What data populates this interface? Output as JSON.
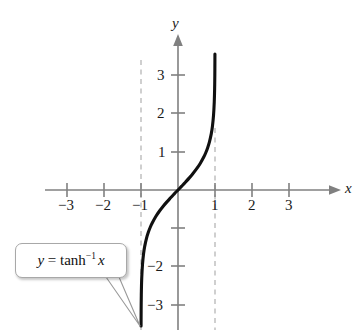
{
  "figure": {
    "background_color": "#ffffff",
    "width": 362,
    "height": 334
  },
  "chart_data": {
    "type": "line",
    "title": "",
    "xlabel": "x",
    "ylabel": "y",
    "function": "y = tanh^-1 x",
    "function_display": "y = tanh⁻¹ x",
    "xlim": [
      -3.9,
      4.1
    ],
    "ylim": [
      -3.7,
      3.8
    ],
    "grid": false,
    "legend": "none",
    "curve_color": "#101010",
    "axis_color": "#808080",
    "asymptote_color": "#b0b0b0",
    "asymptote_style": "dashed",
    "asymptotes": [
      {
        "type": "vertical",
        "x": -1
      },
      {
        "type": "vertical",
        "x": 1
      }
    ],
    "x_ticks": [
      -3,
      -2,
      -1,
      1,
      2,
      3
    ],
    "x_tick_labels": [
      "−3",
      "−2",
      "−1",
      "1",
      "2",
      "3"
    ],
    "y_ticks": [
      3,
      2,
      1,
      -1,
      -2,
      -3
    ],
    "y_tick_labels": [
      "3",
      "2",
      "1",
      "",
      "−2",
      "−3"
    ],
    "series": [
      {
        "name": "y = tanh^-1 x",
        "x": [
          -0.9982,
          -0.9975,
          -0.9951,
          -0.99,
          -0.98,
          -0.96,
          -0.93,
          -0.9,
          -0.85,
          -0.8,
          -0.75,
          -0.7,
          -0.6,
          -0.5,
          -0.4,
          -0.3,
          -0.2,
          -0.1,
          0.0,
          0.1,
          0.2,
          0.3,
          0.4,
          0.5,
          0.6,
          0.7,
          0.75,
          0.8,
          0.85,
          0.9,
          0.93,
          0.96,
          0.98,
          0.99,
          0.9951,
          0.9975,
          0.9982
        ],
        "y": [
          -3.55,
          -3.4,
          -3.0,
          -2.646,
          -2.298,
          -1.946,
          -1.658,
          -1.472,
          -1.256,
          -1.099,
          -0.973,
          -0.867,
          -0.693,
          -0.549,
          -0.424,
          -0.31,
          -0.203,
          -0.1,
          0.0,
          0.1,
          0.203,
          0.31,
          0.424,
          0.549,
          0.693,
          0.867,
          0.973,
          1.099,
          1.256,
          1.472,
          1.658,
          1.946,
          2.298,
          2.646,
          3.0,
          3.4,
          3.55
        ]
      }
    ]
  },
  "axis_labels": {
    "x": "x",
    "y": "y"
  },
  "x_tick_labels": [
    {
      "text": "−3",
      "value": -3
    },
    {
      "text": "−2",
      "value": -2
    },
    {
      "text": "−1",
      "value": -1
    },
    {
      "text": "1",
      "value": 1
    },
    {
      "text": "2",
      "value": 2
    },
    {
      "text": "3",
      "value": 3
    }
  ],
  "y_tick_labels": [
    {
      "text": "3",
      "value": 3
    },
    {
      "text": "2",
      "value": 2
    },
    {
      "text": "1",
      "value": 1
    },
    {
      "text": "−2",
      "value": -2
    },
    {
      "text": "−3",
      "value": -3
    }
  ],
  "callout": {
    "lhs": "y",
    "equals": " = ",
    "func": "tanh",
    "exponent": "−1",
    "arg": "x",
    "full_text": "y = tanh⁻¹ x",
    "border_color": "#a8a8a8",
    "background_color": "#ffffff"
  }
}
